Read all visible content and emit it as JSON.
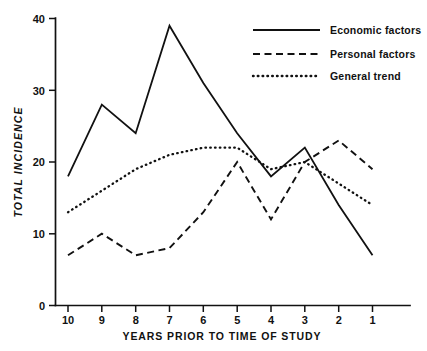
{
  "chart_data": {
    "type": "line",
    "title": "",
    "xlabel": "YEARS PRIOR TO TIME OF STUDY",
    "ylabel": "TOTAL INCIDENCE",
    "categories": [
      "10",
      "9",
      "8",
      "7",
      "6",
      "5",
      "4",
      "3",
      "2",
      "1"
    ],
    "x": [
      10,
      9,
      8,
      7,
      6,
      5,
      4,
      3,
      2,
      1
    ],
    "xlim": [
      10,
      1
    ],
    "ylim": [
      0,
      40
    ],
    "yticks": [
      "0",
      "10",
      "20",
      "30",
      "40"
    ],
    "ytick_values": [
      0,
      10,
      20,
      30,
      40
    ],
    "grid": false,
    "legend_position": "top-right",
    "series": [
      {
        "name": "Economic factors",
        "style": "solid",
        "values": [
          18,
          28,
          24,
          39,
          31,
          24,
          18,
          22,
          14,
          7
        ]
      },
      {
        "name": "Personal factors",
        "style": "dashed",
        "values": [
          7,
          10,
          7,
          8,
          13,
          20,
          12,
          20,
          23,
          19
        ]
      },
      {
        "name": "General trend",
        "style": "dotted",
        "values": [
          13,
          16,
          19,
          21,
          22,
          22,
          19,
          20,
          17,
          14
        ]
      }
    ]
  },
  "legend": {
    "items": [
      {
        "label": "Economic factors",
        "style": "solid"
      },
      {
        "label": "Personal factors",
        "style": "dashed"
      },
      {
        "label": "General trend",
        "style": "dotted"
      }
    ]
  },
  "axes": {
    "y_title": "TOTAL INCIDENCE",
    "x_title": "YEARS PRIOR TO TIME OF STUDY",
    "y_tick_labels": [
      "40",
      "30",
      "20",
      "10",
      "0"
    ],
    "x_tick_labels": [
      "10",
      "9",
      "8",
      "7",
      "6",
      "5",
      "4",
      "3",
      "2",
      "1"
    ]
  },
  "colors": {
    "ink": "#111111",
    "background": "#ffffff"
  }
}
